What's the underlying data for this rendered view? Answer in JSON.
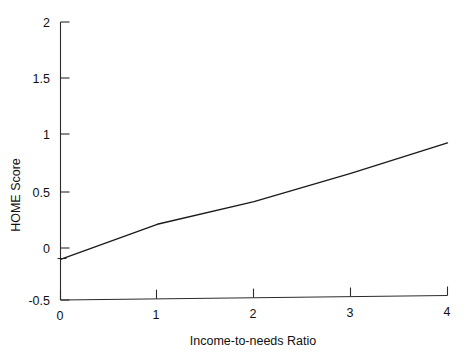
{
  "chart_data": {
    "type": "line",
    "title": "",
    "xlabel": "Income-to-needs Ratio",
    "ylabel": "HOME Score",
    "xlim": [
      0,
      4
    ],
    "ylim": [
      -0.5,
      2
    ],
    "xticks": [
      0,
      1,
      2,
      3,
      4
    ],
    "xticklabels": [
      "0",
      "1",
      "2",
      "3",
      "4"
    ],
    "yticks": [
      -0.5,
      0,
      0.5,
      1,
      1.5,
      2
    ],
    "yticklabels": [
      "-0.5",
      "0",
      "0.5",
      "1",
      "1.5",
      "2"
    ],
    "grid": false,
    "legend": null,
    "series": [
      {
        "name": "Predicted HOME Score",
        "x": [
          0,
          1,
          2,
          3,
          4
        ],
        "values": [
          -0.1,
          0.21,
          0.41,
          0.66,
          0.93
        ]
      }
    ],
    "annotations": []
  },
  "axes": {
    "y_title": "HOME Score",
    "x_title": "Income-to-needs Ratio",
    "y_ticks": [
      {
        "label": "2",
        "value": 2
      },
      {
        "label": "1.5",
        "value": 1.5
      },
      {
        "label": "1",
        "value": 1
      },
      {
        "label": "0.5",
        "value": 0.5
      },
      {
        "label": "0",
        "value": 0
      },
      {
        "label": "-0.5",
        "value": -0.5
      }
    ],
    "x_ticks": [
      {
        "label": "0",
        "value": 0
      },
      {
        "label": "1",
        "value": 1
      },
      {
        "label": "2",
        "value": 2
      },
      {
        "label": "3",
        "value": 3
      },
      {
        "label": "4",
        "value": 4
      }
    ]
  },
  "style": {
    "background": "#ffffff",
    "axis_color": "#2b2b2b",
    "line_color": "#1a1a1a",
    "text_color": "#111111"
  }
}
